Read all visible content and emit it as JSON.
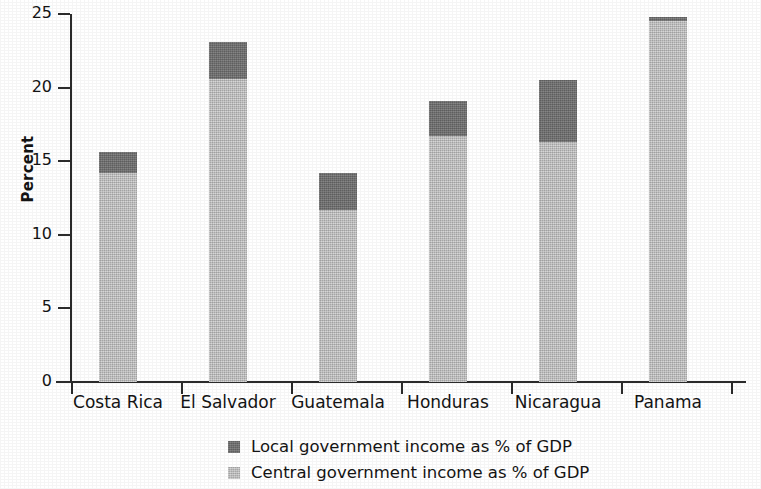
{
  "chart_data": {
    "type": "bar",
    "subtype": "stacked-bar",
    "title": "",
    "xlabel": "",
    "ylabel": "Percent",
    "ylim": [
      0,
      25
    ],
    "yticks": [
      0,
      5,
      10,
      15,
      20,
      25
    ],
    "ytick_labels": [
      "0",
      "5",
      "10",
      "15",
      "20",
      "25"
    ],
    "grid": false,
    "legend_position": "bottom",
    "categories": [
      "Costa Rica",
      "El Salvador",
      "Guatemala",
      "Honduras",
      "Nicaragua",
      "Panama"
    ],
    "series": [
      {
        "name": "Central government income as % of GDP",
        "color": "#bfbfbf",
        "values": [
          14.2,
          20.6,
          11.7,
          16.7,
          16.3,
          24.5
        ]
      },
      {
        "name": "Local government income as % of GDP",
        "color": "#6f6f6f",
        "values": [
          1.4,
          2.5,
          2.5,
          2.4,
          4.2,
          0.3
        ]
      }
    ],
    "totals": [
      15.6,
      23.1,
      14.2,
      19.1,
      20.5,
      24.8
    ]
  },
  "axes": {
    "y_title": "Percent",
    "y_ticks": [
      {
        "label": "25",
        "value": 25
      },
      {
        "label": "20",
        "value": 20
      },
      {
        "label": "15",
        "value": 15
      },
      {
        "label": "10",
        "value": 10
      },
      {
        "label": "5",
        "value": 5
      },
      {
        "label": "0",
        "value": 0
      }
    ],
    "x_categories": [
      {
        "label": "Costa Rica"
      },
      {
        "label": "El Salvador"
      },
      {
        "label": "Guatemala"
      },
      {
        "label": "Honduras"
      },
      {
        "label": "Nicaragua"
      },
      {
        "label": "Panama"
      }
    ]
  },
  "legend": {
    "items": [
      {
        "label": "Local government income as % of GDP",
        "color": "#6f6f6f",
        "series": "local"
      },
      {
        "label": "Central government income as % of GDP",
        "color": "#bfbfbf",
        "series": "central"
      }
    ]
  }
}
